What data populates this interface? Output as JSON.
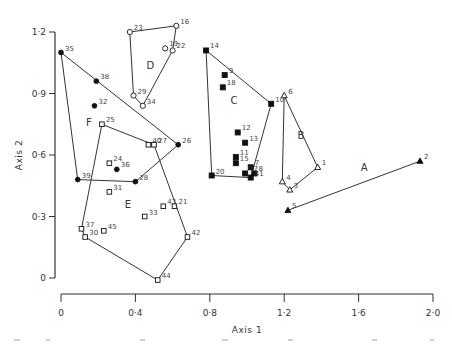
{
  "chart_data": {
    "type": "scatter",
    "title": "",
    "xlabel": "Axis 1",
    "ylabel": "Axis 2",
    "xlim": [
      0,
      2.0
    ],
    "ylim": [
      0,
      1.2
    ],
    "xticks": [
      0,
      0.4,
      0.8,
      1.2,
      1.6,
      2.0
    ],
    "xtick_labels": [
      "0",
      "0·4",
      "0·8",
      "1·2",
      "1·6",
      "2·0"
    ],
    "yticks": [
      0,
      0.3,
      0.6,
      0.9,
      1.2
    ],
    "ytick_labels": [
      "0",
      "0·3",
      "0·6",
      "0·9",
      "1·2"
    ],
    "grid": false,
    "legend": "none (groups labelled A–F inside convex hulls)",
    "groups": [
      {
        "name": "A",
        "marker": "filled-triangle",
        "label_pos": [
          1.63,
          0.52
        ],
        "points": [
          {
            "id": "2",
            "x": 1.93,
            "y": 0.57
          },
          {
            "id": "5",
            "x": 1.22,
            "y": 0.33
          }
        ],
        "hull": [
          "2",
          "5"
        ]
      },
      {
        "name": "B",
        "marker": "open-triangle",
        "label_pos": [
          1.29,
          0.68
        ],
        "points": [
          {
            "id": "6",
            "x": 1.2,
            "y": 0.89
          },
          {
            "id": "1",
            "x": 1.38,
            "y": 0.54
          },
          {
            "id": "4",
            "x": 1.19,
            "y": 0.47
          },
          {
            "id": "3",
            "x": 1.23,
            "y": 0.43
          }
        ],
        "hull": [
          "6",
          "1",
          "3",
          "4"
        ]
      },
      {
        "name": "C",
        "marker": "filled-square",
        "label_pos": [
          0.93,
          0.85
        ],
        "points": [
          {
            "id": "14",
            "x": 0.78,
            "y": 1.11
          },
          {
            "id": "9",
            "x": 0.88,
            "y": 0.99
          },
          {
            "id": "18",
            "x": 0.87,
            "y": 0.93
          },
          {
            "id": "10",
            "x": 1.13,
            "y": 0.85
          },
          {
            "id": "12",
            "x": 0.95,
            "y": 0.71
          },
          {
            "id": "13",
            "x": 0.99,
            "y": 0.66
          },
          {
            "id": "11",
            "x": 0.94,
            "y": 0.59
          },
          {
            "id": "15",
            "x": 0.94,
            "y": 0.56
          },
          {
            "id": "7",
            "x": 1.02,
            "y": 0.54
          },
          {
            "id": "8",
            "x": 1.04,
            "y": 0.51
          },
          {
            "id": "17",
            "x": 0.99,
            "y": 0.51
          },
          {
            "id": "41",
            "x": 1.02,
            "y": 0.49
          },
          {
            "id": "20",
            "x": 0.81,
            "y": 0.5
          }
        ],
        "hull": [
          "14",
          "10",
          "41",
          "20"
        ]
      },
      {
        "name": "D",
        "marker": "open-circle",
        "label_pos": [
          0.48,
          1.02
        ],
        "points": [
          {
            "id": "23",
            "x": 0.37,
            "y": 1.2
          },
          {
            "id": "16",
            "x": 0.62,
            "y": 1.23
          },
          {
            "id": "19",
            "x": 0.56,
            "y": 1.12
          },
          {
            "id": "22",
            "x": 0.6,
            "y": 1.11
          },
          {
            "id": "29",
            "x": 0.39,
            "y": 0.89
          },
          {
            "id": "34",
            "x": 0.44,
            "y": 0.84
          }
        ],
        "hull": [
          "23",
          "16",
          "22",
          "34",
          "29"
        ]
      },
      {
        "name": "E",
        "marker": "open-square",
        "label_pos": [
          0.36,
          0.34
        ],
        "points": [
          {
            "id": "25",
            "x": 0.22,
            "y": 0.75
          },
          {
            "id": "40",
            "x": 0.47,
            "y": 0.65
          },
          {
            "id": "27",
            "x": 0.5,
            "y": 0.65
          },
          {
            "id": "24",
            "x": 0.26,
            "y": 0.56
          },
          {
            "id": "31",
            "x": 0.26,
            "y": 0.42
          },
          {
            "id": "43",
            "x": 0.55,
            "y": 0.35
          },
          {
            "id": "21",
            "x": 0.61,
            "y": 0.35
          },
          {
            "id": "33",
            "x": 0.45,
            "y": 0.3
          },
          {
            "id": "37",
            "x": 0.11,
            "y": 0.24
          },
          {
            "id": "30",
            "x": 0.13,
            "y": 0.2
          },
          {
            "id": "45",
            "x": 0.23,
            "y": 0.23
          },
          {
            "id": "42",
            "x": 0.68,
            "y": 0.2
          },
          {
            "id": "44",
            "x": 0.52,
            "y": -0.01
          }
        ],
        "hull": [
          "25",
          "27",
          "42",
          "44",
          "30",
          "37"
        ]
      },
      {
        "name": "F",
        "marker": "filled-circle",
        "label_pos": [
          0.15,
          0.74
        ],
        "points": [
          {
            "id": "35",
            "x": 0.0,
            "y": 1.1
          },
          {
            "id": "38",
            "x": 0.19,
            "y": 0.96
          },
          {
            "id": "32",
            "x": 0.18,
            "y": 0.84
          },
          {
            "id": "26",
            "x": 0.63,
            "y": 0.65
          },
          {
            "id": "36",
            "x": 0.3,
            "y": 0.53
          },
          {
            "id": "39",
            "x": 0.09,
            "y": 0.48
          },
          {
            "id": "28",
            "x": 0.4,
            "y": 0.47
          }
        ],
        "hull": [
          "35",
          "26",
          "28",
          "39"
        ]
      }
    ]
  },
  "axes": {
    "x_title": "Axis 1",
    "y_title": "Axis 2"
  }
}
